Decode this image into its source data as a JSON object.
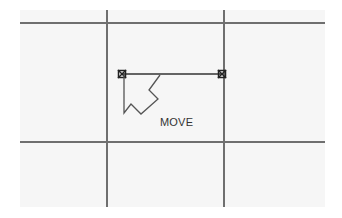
{
  "canvas": {
    "background": "#f6f6f6",
    "grid_color": "#6f6f6f",
    "horizontal_lines_y": [
      23,
      142
    ],
    "vertical_lines_x": [
      107,
      224
    ]
  },
  "segment": {
    "start": [
      122,
      74
    ],
    "end": [
      222,
      74
    ],
    "color": "#333333"
  },
  "cursor": {
    "icon": "move-arrow-icon",
    "label": "MOVE"
  }
}
